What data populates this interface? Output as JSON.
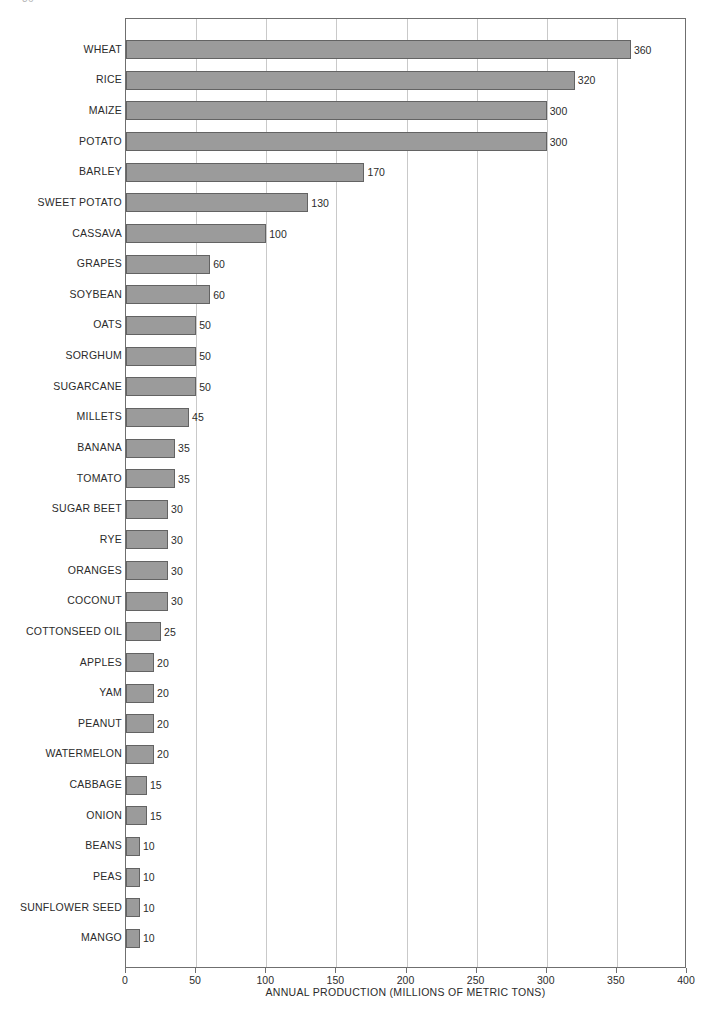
{
  "page": {
    "folio": "36",
    "width": 710,
    "height": 1023
  },
  "colors": {
    "bar_fill": "#9b9b9b",
    "bar_stroke": "#636363",
    "gridline": "#c9c9c9",
    "frame": "#6f6f6f",
    "text": "#2b2b2b",
    "background": "#ffffff"
  },
  "chart_data": {
    "type": "bar",
    "orientation": "horizontal",
    "title": "",
    "xlabel": "ANNUAL PRODUCTION (MILLIONS OF METRIC TONS)",
    "ylabel": "",
    "xlim": [
      0,
      400
    ],
    "xticks": [
      0,
      50,
      100,
      150,
      200,
      250,
      300,
      350,
      400
    ],
    "xtick_labels": [
      "0",
      "50",
      "100",
      "150",
      "200",
      "250",
      "300",
      "350",
      "400"
    ],
    "grid": "vertical",
    "legend": "none",
    "data_labels": true,
    "categories": [
      "WHEAT",
      "RICE",
      "MAIZE",
      "POTATO",
      "BARLEY",
      "SWEET POTATO",
      "CASSAVA",
      "GRAPES",
      "SOYBEAN",
      "OATS",
      "SORGHUM",
      "SUGARCANE",
      "MILLETS",
      "BANANA",
      "TOMATO",
      "SUGAR  BEET",
      "RYE",
      "ORANGES",
      "COCONUT",
      "COTTONSEED OIL",
      "APPLES",
      "YAM",
      "PEANUT",
      "WATERMELON",
      "CABBAGE",
      "ONION",
      "BEANS",
      "PEAS",
      "SUNFLOWER SEED",
      "MANGO"
    ],
    "values": [
      360,
      320,
      300,
      300,
      170,
      130,
      100,
      60,
      60,
      50,
      50,
      50,
      45,
      35,
      35,
      30,
      30,
      30,
      30,
      25,
      20,
      20,
      20,
      20,
      15,
      15,
      10,
      10,
      10,
      10
    ],
    "value_labels": [
      "360",
      "320",
      "300",
      "300",
      "170",
      "130",
      "100",
      "60",
      "60",
      "50",
      "50",
      "50",
      "45",
      "35",
      "35",
      "30",
      "30",
      "30",
      "30",
      "25",
      "20",
      "20",
      "20",
      "20",
      "15",
      "15",
      "10",
      "10",
      "10",
      "10"
    ]
  }
}
